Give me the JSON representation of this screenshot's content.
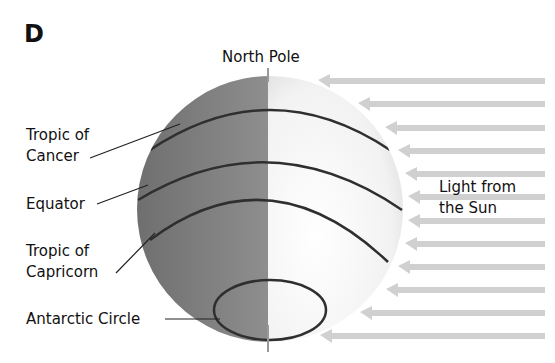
{
  "panel_label": "D",
  "labels": {
    "north_pole": "North Pole",
    "tropic_cancer_1": "Tropic of",
    "tropic_cancer_2": "Cancer",
    "equator": "Equator",
    "tropic_capricorn_1": "Tropic of",
    "tropic_capricorn_2": "Capricorn",
    "antarctic_circle": "Antarctic Circle",
    "sun_1": "Light from",
    "sun_2": "the Sun"
  },
  "colors": {
    "night_side": "#7a7a7a",
    "day_side": "#e6e6e6",
    "arrows": "#cfcfcf",
    "lines": "#333333"
  },
  "arrow_count": 12
}
